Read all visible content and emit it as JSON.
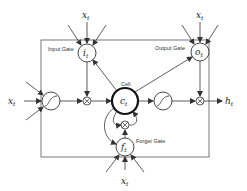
{
  "diagram": {
    "labels": {
      "input_gate": "Input Gate",
      "output_gate": "Output Gate",
      "forget_gate": "Forget Gate",
      "cell": "Cell"
    },
    "nodes": {
      "input_gate": {
        "var": "i",
        "sub": "t"
      },
      "output_gate": {
        "var": "o",
        "sub": "t"
      },
      "forget_gate": {
        "var": "f",
        "sub": "t"
      },
      "cell": {
        "var": "c",
        "sub": "t"
      }
    },
    "inputs": {
      "top_left": {
        "var": "x",
        "sub": "t"
      },
      "top_right": {
        "var": "x",
        "sub": "t"
      },
      "left": {
        "var": "x",
        "sub": "t"
      },
      "bottom": {
        "var": "x",
        "sub": "t"
      }
    },
    "output": {
      "var": "h",
      "sub": "t"
    },
    "multiply_symbol": "⊗",
    "colors": {
      "stroke": "#333333",
      "background": "#ffffff"
    }
  }
}
